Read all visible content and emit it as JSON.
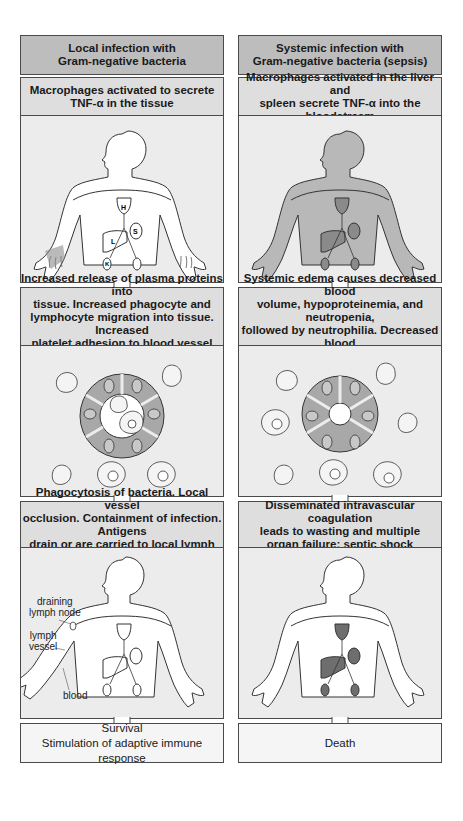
{
  "left": {
    "header": "Local infection with\nGram-negative bacteria",
    "header_line1": "Local infection with",
    "header_line2": "Gram-negative bacteria",
    "step1_line1": "Macrophages activated to secrete",
    "step1_line2": "TNF-α in the tissue",
    "step1_organ_labels": [
      "H",
      "S",
      "L",
      "K"
    ],
    "step2_lines": [
      "Increased release of plasma proteins into",
      "tissue. Increased phagocyte and",
      "lymphocyte migration into tissue. Increased",
      "platelet adhesion to blood vessel wall"
    ],
    "step3_lines": [
      "Phagocytosis of bacteria. Local vessel",
      "occlusion. Containment of infection. Antigens",
      "drain or are carried to local lymph node"
    ],
    "step3_labels": {
      "lymph_node_1": "draining",
      "lymph_node_2": "lymph node",
      "lymph_vessel_1": "lymph",
      "lymph_vessel_2": "vessel",
      "blood": "blood"
    },
    "outcome_line1": "Survival",
    "outcome_line2": "Stimulation of adaptive immune response"
  },
  "right": {
    "header_line1": "Systemic infection with",
    "header_line2": "Gram-negative bacteria (sepsis)",
    "step1_line1": "Macrophages activated in the liver and",
    "step1_line2": "spleen secrete TNF-α into the bloodstream",
    "step2_lines": [
      "Systemic edema causes decreased blood",
      "volume, hypoproteinemia, and neutropenia,",
      "followed by neutrophilia. Decreased blood",
      "volume causes collapse of vessels."
    ],
    "step3_lines": [
      "Disseminated intravascular coagulation",
      "leads to wasting and multiple",
      "organ failure: septic shock"
    ],
    "outcome": "Death"
  },
  "colors": {
    "header_bg": "#bdbdbd",
    "caption_bg": "#dedede",
    "panel_bg": "#ececec",
    "outcome_bg": "#f5f5f5",
    "body_tint_systemic": "#b8b8b8",
    "organ_dark": "#7a7a7a",
    "cell_gray": "#a8a8a8"
  }
}
